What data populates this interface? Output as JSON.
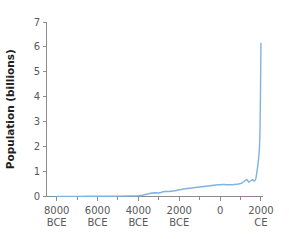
{
  "chart_data": {
    "type": "line",
    "title": "",
    "subtitle": "",
    "xlabel": "",
    "ylabel": "Population (billions)",
    "xlim": [
      -8500,
      2100
    ],
    "ylim": [
      0,
      7
    ],
    "grid": false,
    "legend": false,
    "legend_position": "none",
    "line_color": "#7fb3e0",
    "axis_color": "#8c8c8c",
    "axis_color_right": "#9c7f8e",
    "text_color": "#58595b",
    "title_color": "#231f20",
    "background_color": "#ffffff",
    "y_ticks": [
      0,
      1,
      2,
      3,
      4,
      5,
      6,
      7
    ],
    "y_tick_labels": [
      "0",
      "1",
      "2",
      "3",
      "4",
      "5",
      "6",
      "7"
    ],
    "x_major_ticks": [
      -8000,
      -6000,
      -4000,
      -2000,
      0,
      2000
    ],
    "x_major_tick_labels": [
      "8000\nBCE",
      "6000\nBCE",
      "4000\nBCE",
      "2000\nBCE",
      "0",
      "2000\nCE"
    ],
    "x_minor_ticks": [
      -7000,
      -5000,
      -3000,
      -1000,
      1000
    ],
    "x_tick_label_lines": [
      [
        "8000",
        "BCE"
      ],
      [
        "6000",
        "BCE"
      ],
      [
        "4000",
        "BCE"
      ],
      [
        "2000",
        "BCE"
      ],
      [
        "0",
        ""
      ],
      [
        "2000",
        "CE"
      ]
    ],
    "series": [
      {
        "name": "World population",
        "x": [
          -8000,
          -7500,
          -7000,
          -6500,
          -6000,
          -5500,
          -5000,
          -4500,
          -4000,
          -3800,
          -3600,
          -3400,
          -3200,
          -3000,
          -2900,
          -2800,
          -2700,
          -2600,
          -2500,
          -2400,
          -2300,
          -2200,
          -2100,
          -2000,
          -1900,
          -1800,
          -1700,
          -1600,
          -1500,
          -1400,
          -1300,
          -1200,
          -1100,
          -1000,
          -900,
          -800,
          -700,
          -600,
          -500,
          -400,
          -300,
          -200,
          -100,
          0,
          100,
          200,
          300,
          400,
          500,
          600,
          700,
          800,
          900,
          1000,
          1100,
          1200,
          1250,
          1300,
          1340,
          1400,
          1450,
          1500,
          1550,
          1600,
          1650,
          1700,
          1750,
          1800,
          1850,
          1900,
          1927,
          1950,
          1960,
          1974,
          1987,
          1999,
          2000
        ],
        "y": [
          0.005,
          0.006,
          0.007,
          0.008,
          0.01,
          0.012,
          0.015,
          0.02,
          0.03,
          0.05,
          0.09,
          0.13,
          0.15,
          0.14,
          0.16,
          0.19,
          0.2,
          0.2,
          0.2,
          0.21,
          0.22,
          0.23,
          0.25,
          0.27,
          0.28,
          0.3,
          0.31,
          0.32,
          0.33,
          0.34,
          0.35,
          0.36,
          0.37,
          0.38,
          0.39,
          0.4,
          0.41,
          0.42,
          0.43,
          0.44,
          0.45,
          0.46,
          0.47,
          0.47,
          0.48,
          0.48,
          0.47,
          0.47,
          0.47,
          0.47,
          0.48,
          0.49,
          0.5,
          0.52,
          0.56,
          0.62,
          0.66,
          0.68,
          0.66,
          0.57,
          0.6,
          0.63,
          0.66,
          0.67,
          0.62,
          0.63,
          0.71,
          0.98,
          1.26,
          1.65,
          2.0,
          2.52,
          3.02,
          4.0,
          5.0,
          6.0,
          6.15
        ]
      }
    ]
  }
}
